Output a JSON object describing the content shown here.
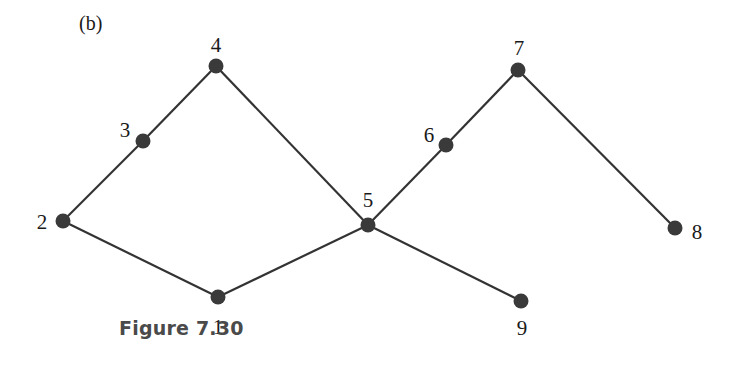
{
  "panel_label": "(b)",
  "caption": "Figure 7.30",
  "colors": {
    "node": "#3a3a3a",
    "edge": "#333333",
    "caption": "#4a4a4a"
  },
  "graph": {
    "nodes": [
      {
        "id": "1",
        "label": "1",
        "x": 218,
        "y": 297,
        "lx": 218,
        "ly": 334,
        "anchor": "middle"
      },
      {
        "id": "2",
        "label": "2",
        "x": 63,
        "y": 221,
        "lx": 42,
        "ly": 229,
        "anchor": "middle"
      },
      {
        "id": "3",
        "label": "3",
        "x": 143,
        "y": 141,
        "lx": 125,
        "ly": 137,
        "anchor": "middle"
      },
      {
        "id": "4",
        "label": "4",
        "x": 216,
        "y": 66,
        "lx": 216,
        "ly": 52,
        "anchor": "middle"
      },
      {
        "id": "5",
        "label": "5",
        "x": 368,
        "y": 225,
        "lx": 368,
        "ly": 207,
        "anchor": "middle"
      },
      {
        "id": "6",
        "label": "6",
        "x": 446,
        "y": 145,
        "lx": 429,
        "ly": 142,
        "anchor": "middle"
      },
      {
        "id": "7",
        "label": "7",
        "x": 518,
        "y": 70,
        "lx": 519,
        "ly": 55,
        "anchor": "middle"
      },
      {
        "id": "8",
        "label": "8",
        "x": 675,
        "y": 228,
        "lx": 697,
        "ly": 239,
        "anchor": "middle"
      },
      {
        "id": "9",
        "label": "9",
        "x": 521,
        "y": 301,
        "lx": 522,
        "ly": 335,
        "anchor": "middle"
      }
    ],
    "edges": [
      [
        "1",
        "2"
      ],
      [
        "2",
        "3"
      ],
      [
        "3",
        "4"
      ],
      [
        "4",
        "5"
      ],
      [
        "5",
        "1"
      ],
      [
        "5",
        "6"
      ],
      [
        "6",
        "7"
      ],
      [
        "7",
        "8"
      ],
      [
        "5",
        "9"
      ]
    ]
  }
}
